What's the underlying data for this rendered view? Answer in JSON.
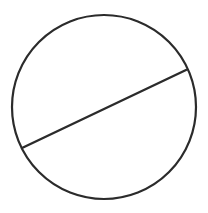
{
  "canvas": {
    "width": 208,
    "height": 213,
    "background_color": "#ffffff"
  },
  "figure": {
    "kind": "geometry-diagram",
    "stroke_color": "#2b2b2b",
    "fill_color": "none",
    "labels": [],
    "annotations": []
  },
  "chart_data": {
    "type": "scatter",
    "title": "",
    "xlabel": "",
    "ylabel": "",
    "grid": false,
    "legend": null,
    "xlim": [
      0,
      208
    ],
    "ylim": [
      0,
      213
    ],
    "shapes": [
      {
        "name": "circle",
        "type": "circle",
        "cx": 104,
        "cy": 107,
        "r": 92,
        "stroke": "#2b2b2b",
        "stroke_width": 2.2,
        "fill": "none"
      },
      {
        "name": "chord",
        "type": "line",
        "x1": 22,
        "y1": 148,
        "x2": 186,
        "y2": 70,
        "stroke": "#2b2b2b",
        "stroke_width": 2.4
      }
    ]
  }
}
